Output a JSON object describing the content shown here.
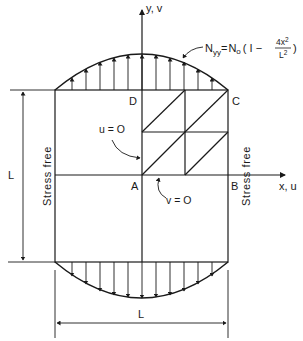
{
  "figure": {
    "axis_labels": {
      "y": "y, v",
      "x": "x, u"
    },
    "corner_labels": {
      "A": "A",
      "B": "B",
      "C": "C",
      "D": "D"
    },
    "boundary_conditions": {
      "left_edge": "u = O",
      "bottom_edge": "v = O"
    },
    "edge_labels": {
      "left": "Stress free",
      "right": "Stress free"
    },
    "load_equation": {
      "lhs": "N",
      "lhs_sub": "yy",
      "equals": "=",
      "rhs_base": "N",
      "rhs_sub": "o",
      "open": "( I −",
      "numerator": "4x",
      "numerator_sup": "2",
      "denominator": "L",
      "denominator_sup": "2",
      "close": ")"
    },
    "dimensions": {
      "vertical": "L",
      "horizontal": "L"
    },
    "colors": {
      "line": "#1a1a1a",
      "background": "#ffffff"
    }
  }
}
